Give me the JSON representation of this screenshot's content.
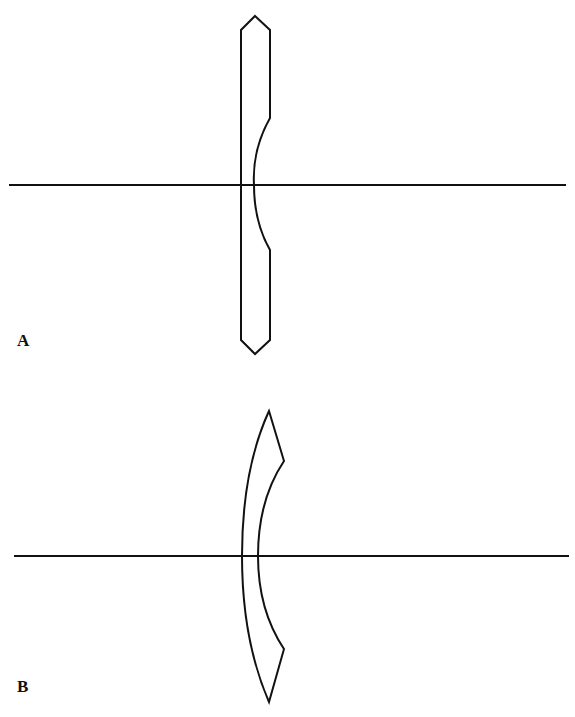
{
  "figure": {
    "panels": [
      {
        "label": "A",
        "description": "Plano-concave lens with beveled edges, cross-section on optical axis",
        "axis": {
          "x1": 9,
          "x2": 566,
          "y": 185
        }
      },
      {
        "label": "B",
        "description": "Meniscus (concavo-convex) lens cross-section on optical axis",
        "axis": {
          "x1": 14,
          "x2": 569,
          "y": 556
        }
      }
    ],
    "stroke_color": "#111111",
    "background": "#ffffff"
  }
}
